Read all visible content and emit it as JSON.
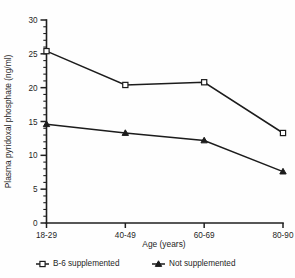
{
  "chart_data": {
    "type": "line",
    "title": "",
    "xlabel": "Age (years)",
    "ylabel": "Plasma pyridoxal phosphate (ng/ml)",
    "categories": [
      "18-29",
      "40-49",
      "60-69",
      "80-90"
    ],
    "ylim": [
      0,
      30
    ],
    "yticks": [
      0,
      5,
      10,
      15,
      20,
      25,
      30
    ],
    "ytick_labels": [
      "0",
      "5",
      "10",
      "15",
      "20",
      "25",
      "30"
    ],
    "y_minor_step": 1,
    "grid": false,
    "legend_position": "below",
    "series": [
      {
        "name": "B-6 supplemented",
        "marker": "open-square",
        "values": [
          25.4,
          20.4,
          20.8,
          13.3
        ]
      },
      {
        "name": "Not supplemented",
        "marker": "filled-triangle",
        "values": [
          14.6,
          13.3,
          12.2,
          7.6
        ]
      }
    ]
  },
  "colors": {
    "ink": "#1c1c1c",
    "background": "#fefefe",
    "marker_fill": "#ffffff"
  }
}
